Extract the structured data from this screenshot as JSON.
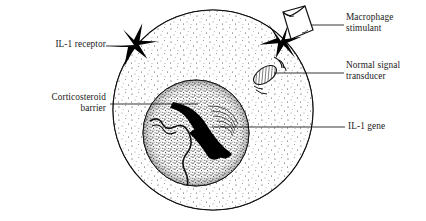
{
  "figure": {
    "background": "#ffffff",
    "ink": "#111111"
  },
  "labels": {
    "il1_receptor": "IL-1 receptor",
    "corticosteroid_barrier": "Corticosteroid\nbarrier",
    "macrophage_stimulant": "Macrophage\nstimulant",
    "normal_signal_transducer": "Normal signal\ntransducer",
    "il1_gene": "IL-1 gene"
  },
  "diagram": {
    "cell": {
      "name": "cell-membrane",
      "cx": 213,
      "cy": 110,
      "r": 100,
      "stroke": "#111111",
      "fill": "#ffffff",
      "cytoplasm_texture": "stipple-sparse"
    },
    "nucleus": {
      "name": "nucleus",
      "cx": 196,
      "cy": 133,
      "r": 53,
      "stroke": "#111111",
      "texture": "stipple-dense"
    },
    "receptors": [
      {
        "name": "il1-receptor-shape",
        "cx": 134,
        "cy": 45,
        "angle": -38,
        "fill": "#000000"
      },
      {
        "name": "macrophage-receptor-shape",
        "cx": 281,
        "cy": 41,
        "angle": 28,
        "fill": "#000000"
      }
    ],
    "stimulant": {
      "name": "macrophage-stimulant-shape",
      "cx": 297,
      "cy": 28,
      "fill": "#ffffff",
      "stroke": "#111111"
    },
    "signal_transducer": {
      "name": "signal-transducer-oval",
      "cx": 265,
      "cy": 75,
      "rx": 13,
      "ry": 7,
      "angle": -35,
      "texture": "diagonal-hatch",
      "motion_arcs": 3
    },
    "gene_strand": {
      "name": "il1-gene-strand",
      "fill": "#000000",
      "description": "thick curved black chromatin strand"
    },
    "secondary_strand": {
      "name": "chromatin-strand",
      "description": "thin wavy strand at left of nucleus"
    },
    "leader_lines": [
      {
        "name": "leader-il1-receptor",
        "x1": 106,
        "y1": 46,
        "x2": 136,
        "y2": 46
      },
      {
        "name": "leader-corticosteroid",
        "x1": 110,
        "y1": 104,
        "x2": 196,
        "y2": 104
      },
      {
        "name": "leader-macrophage",
        "x1": 310,
        "y1": 25,
        "x2": 344,
        "y2": 25
      },
      {
        "name": "leader-transducer",
        "x1": 274,
        "y1": 73,
        "x2": 344,
        "y2": 73
      },
      {
        "name": "leader-il1-gene",
        "x1": 212,
        "y1": 127,
        "x2": 345,
        "y2": 127
      }
    ]
  }
}
